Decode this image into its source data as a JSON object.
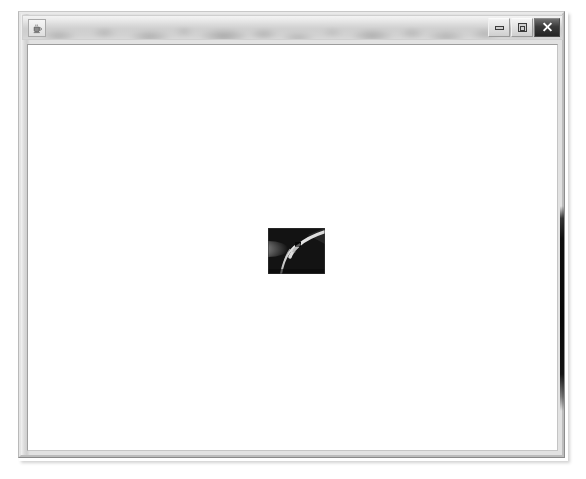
{
  "window": {
    "title": "",
    "title_legible": false,
    "icon": "java-coffee-cup-icon",
    "controls": {
      "minimize_label": "Minimize",
      "maximize_label": "Maximize",
      "close_label": "Close"
    }
  },
  "content": {
    "background_color": "#ffffff",
    "image": {
      "name": "displayed-image",
      "alt": "small dark grayscale photograph with a light curved streak",
      "width": 57,
      "height": 46
    }
  },
  "artifacts": {
    "right_edge_band": "dark vertical band along right window frame"
  },
  "colors": {
    "page_background": "#ffffff",
    "window_frame": "#d6d6d6",
    "title_bar": "#cccccc",
    "content_background": "#ffffff",
    "close_button": "#2b2b2b",
    "image_dark": "#151515",
    "image_light": "#e6e6e6"
  }
}
